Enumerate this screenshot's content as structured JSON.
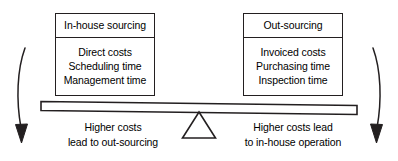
{
  "diagram": {
    "panels": [
      {
        "id": "in-house-sourcing",
        "title": "In-house sourcing",
        "items": [
          "Direct costs",
          "Scheduling time",
          "Management time"
        ]
      },
      {
        "id": "out-sourcing",
        "title": "Out-sourcing",
        "items": [
          "Invoiced costs",
          "Purchasing time",
          "Inspection time"
        ]
      }
    ],
    "captions": [
      {
        "id": "left-caption",
        "line1": "Higher costs",
        "line2": "lead to out-sourcing"
      },
      {
        "id": "right-caption",
        "line1": "Higher costs lead",
        "line2": "to in-house operation"
      }
    ],
    "shapes": {
      "beam": "balance-beam",
      "fulcrum": "fulcrum-triangle",
      "left_arrow": "curved-arrow-down-left",
      "right_arrow": "curved-arrow-down-right"
    },
    "colors": {
      "stroke": "#231f20",
      "background": "#ffffff",
      "beam_fill": "#ffffff"
    }
  }
}
